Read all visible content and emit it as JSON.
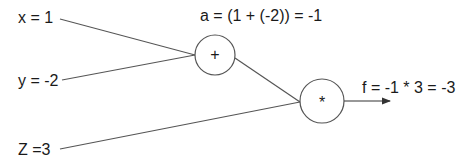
{
  "inputs": {
    "x": "x = 1",
    "y": "y = -2",
    "z": "Z =3"
  },
  "nodes": {
    "add": {
      "symbol": "+",
      "result_label": "a = (1 + (-2)) = -1"
    },
    "mul": {
      "symbol": "*",
      "result_label": "f = -1 * 3 = -3"
    }
  },
  "colors": {
    "stroke": "#555555",
    "text": "#1a1a1a"
  }
}
